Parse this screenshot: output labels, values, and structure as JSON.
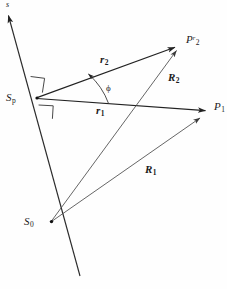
{
  "diagram": {
    "type": "vector-geometry-diagram",
    "width": 227,
    "height": 289,
    "background_color": "#fefefe",
    "stroke_color": "#222222",
    "text_color": "#1b1b1b"
  },
  "labels": {
    "axis_s": "s",
    "point_sp": "S",
    "point_sp_sub": "p",
    "point_s0": "S",
    "point_s0_sub": "0",
    "point_p1": "P",
    "point_p1_sub": "1",
    "point_p2r": "P",
    "point_p2r_sup": "r",
    "point_p2r_sub": "2",
    "vector_r1": "r",
    "vector_r1_sub": "1",
    "vector_r2": "r",
    "vector_r2_sub": "2",
    "vector_R1": "R",
    "vector_R1_sub": "1",
    "vector_R2": "R",
    "vector_R2_sub": "2",
    "angle_phi": "ϕ"
  },
  "geometry": {
    "points": {
      "Sp": [
        37,
        98
      ],
      "S0": [
        51,
        222
      ],
      "P1": [
        213,
        112
      ],
      "P2r": [
        182,
        44
      ],
      "axis_arrow_tip": [
        6,
        12
      ],
      "axis_bottom": [
        80,
        276
      ]
    },
    "vectors": [
      {
        "name": "r1",
        "from": "Sp",
        "to": "P1"
      },
      {
        "name": "r2",
        "from": "Sp",
        "to": "P2r"
      },
      {
        "name": "R1",
        "from": "S0",
        "to": "P1"
      },
      {
        "name": "R2",
        "from": "S0",
        "to": "P2r"
      }
    ],
    "angle": {
      "name": "phi",
      "vertex": "Sp",
      "between": [
        "r1",
        "r2"
      ],
      "arc_radius": 72
    },
    "right_angle_marks": 2
  }
}
